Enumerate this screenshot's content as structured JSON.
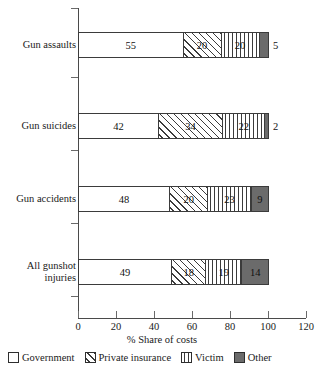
{
  "chart_data": {
    "type": "bar",
    "orientation": "horizontal",
    "stacked": true,
    "title": "",
    "xlabel": "% Share of costs",
    "ylabel": "",
    "xlim": [
      0,
      120
    ],
    "xticks": [
      0,
      20,
      40,
      60,
      80,
      100,
      120
    ],
    "xticklabels": [
      "0",
      "20",
      "40",
      "60",
      "80",
      "100",
      "120"
    ],
    "grid": false,
    "legend_position": "bottom",
    "categories": [
      "Gun assaults",
      "Gun suicides",
      "Gun accidents",
      "All gunshot injuries"
    ],
    "series": [
      {
        "name": "Government",
        "pattern": "solid-white",
        "color": "#ffffff",
        "values": [
          55,
          42,
          48,
          49
        ]
      },
      {
        "name": "Private insurance",
        "pattern": "diagonal-hatch",
        "color": "#ffffff",
        "values": [
          20,
          34,
          20,
          18
        ]
      },
      {
        "name": "Victim",
        "pattern": "vertical-lines",
        "color": "#ffffff",
        "values": [
          20,
          22,
          23,
          19
        ]
      },
      {
        "name": "Other",
        "pattern": "solid-gray",
        "color": "#6b6b6b",
        "values": [
          5,
          2,
          9,
          14
        ]
      }
    ],
    "value_labels": {
      "Gun assaults": [
        "55",
        "20",
        "20",
        "5"
      ],
      "Gun suicides": [
        "42",
        "34",
        "22",
        "2"
      ],
      "Gun accidents": [
        "48",
        "20",
        "23",
        "9"
      ],
      "All gunshot injuries": [
        "49",
        "18",
        "19",
        "14"
      ]
    }
  },
  "axis": {
    "x_title": "% Share of costs",
    "ticks": [
      "0",
      "20",
      "40",
      "60",
      "80",
      "100",
      "120"
    ]
  },
  "categories": [
    {
      "line1": "Gun assaults",
      "line2": ""
    },
    {
      "line1": "Gun suicides",
      "line2": ""
    },
    {
      "line1": "Gun accidents",
      "line2": ""
    },
    {
      "line1": "All gunshot",
      "line2": "injuries"
    }
  ],
  "legend": {
    "items": [
      {
        "label": "Government",
        "swatch": "swatch-government"
      },
      {
        "label": "Private insurance",
        "swatch": "swatch-private-insurance"
      },
      {
        "label": "Victim",
        "swatch": "swatch-victim"
      },
      {
        "label": "Other",
        "swatch": "swatch-other"
      }
    ]
  },
  "colors": {
    "other_fill": "#6b6b6b",
    "outline": "#3b3b3b",
    "axis": "#4a4a4a",
    "background": "#ffffff"
  }
}
